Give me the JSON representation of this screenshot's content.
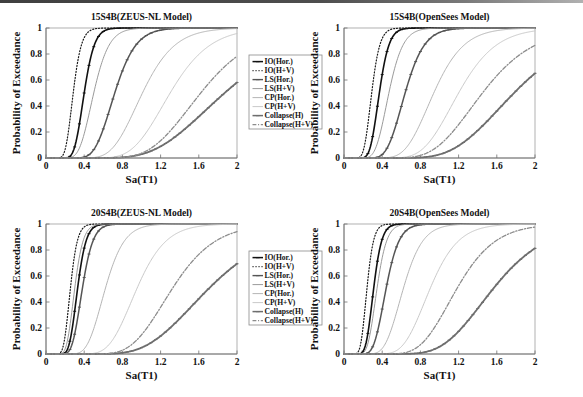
{
  "figure": {
    "background_color": "#ffffff",
    "panel_count": 4
  },
  "axes": {
    "xlabel": "Sa(T1)",
    "ylabel": "Probability of Exceedance",
    "xticks": [
      "0",
      "0.4",
      "0.8",
      "1.2",
      "1.6",
      "2"
    ],
    "yticks": [
      "0",
      "0.2",
      "0.4",
      "0.6",
      "0.8",
      "1"
    ],
    "xlim": [
      0,
      2
    ],
    "ylim": [
      0,
      1
    ]
  },
  "legend": {
    "entries": [
      {
        "label": "IO(Hor.)",
        "style": "solid-marker",
        "color": "#111111",
        "width": 1.5,
        "marker": true
      },
      {
        "label": "IO(H+V)",
        "style": "dotted",
        "color": "#1a1a1a",
        "width": 1.2,
        "marker": false
      },
      {
        "label": "LS(Hor.)",
        "style": "solid-marker",
        "color": "#555555",
        "width": 1.4,
        "marker": true
      },
      {
        "label": "LS(H+V)",
        "style": "solid",
        "color": "#9a9a9a",
        "width": 1.0,
        "marker": false
      },
      {
        "label": "CP(Hor.)",
        "style": "solid",
        "color": "#b5b5b5",
        "width": 1.0,
        "marker": false
      },
      {
        "label": "CP(H+V)",
        "style": "solid",
        "color": "#c9c9c9",
        "width": 1.0,
        "marker": false
      },
      {
        "label": "Collapse(H)",
        "style": "solid-marker",
        "color": "#6e6e6e",
        "width": 1.5,
        "marker": true
      },
      {
        "label": "Collapse(H+V)",
        "style": "dashdot",
        "color": "#8c8c8c",
        "width": 1.2,
        "marker": false
      }
    ]
  },
  "chart_data": [
    {
      "id": "panel-top-left",
      "type": "line",
      "title": "15S4B(ZEUS-NL Model)",
      "xlabel": "Sa(T1)",
      "ylabel": "Probability of Exceedance",
      "xlim": [
        0,
        2
      ],
      "ylim": [
        0,
        1
      ],
      "xticks": [
        0,
        0.4,
        0.8,
        1.2,
        1.6,
        2
      ],
      "yticks": [
        0,
        0.2,
        0.4,
        0.6,
        0.8,
        1
      ],
      "grid": false,
      "legend_position": "right-outside",
      "curve_model": "lognormal-cdf",
      "series": [
        {
          "name": "IO(Hor.)",
          "median": 0.4,
          "beta": 0.21,
          "style": "solid-marker",
          "color": "#111111",
          "width": 1.6
        },
        {
          "name": "IO(H+V)",
          "median": 0.285,
          "beta": 0.235,
          "style": "dotted",
          "color": "#1a1a1a",
          "width": 1.2
        },
        {
          "name": "LS(Hor.)",
          "median": 0.72,
          "beta": 0.24,
          "style": "solid-marker",
          "color": "#555555",
          "width": 1.5
        },
        {
          "name": "LS(H+V)",
          "median": 0.5,
          "beta": 0.25,
          "style": "solid",
          "color": "#9a9a9a",
          "width": 1.0
        },
        {
          "name": "CP(Hor.)",
          "median": 1.01,
          "beta": 0.26,
          "style": "solid",
          "color": "#b5b5b5",
          "width": 1.0
        },
        {
          "name": "CP(H+V)",
          "median": 1.3,
          "beta": 0.25,
          "style": "solid",
          "color": "#c9c9c9",
          "width": 1.0
        },
        {
          "name": "Collapse(H)",
          "median": 1.87,
          "beta": 0.33,
          "style": "solid-marker",
          "color": "#6e6e6e",
          "width": 1.8
        },
        {
          "name": "Collapse(H+V)",
          "median": 1.62,
          "beta": 0.27,
          "style": "dashdot",
          "color": "#8c8c8c",
          "width": 1.3
        }
      ]
    },
    {
      "id": "panel-top-right",
      "type": "line",
      "title": "15S4B(OpenSees Model)",
      "xlabel": "Sa(T1)",
      "ylabel": "Probability of Exceedance",
      "xlim": [
        0,
        2
      ],
      "ylim": [
        0,
        1
      ],
      "xticks": [
        0,
        0.4,
        0.8,
        1.2,
        1.6,
        2
      ],
      "yticks": [
        0,
        0.2,
        0.4,
        0.6,
        0.8,
        1
      ],
      "grid": false,
      "legend_position": "none",
      "curve_model": "lognormal-cdf",
      "series": [
        {
          "name": "IO(Hor.)",
          "median": 0.37,
          "beta": 0.215,
          "style": "solid-marker",
          "color": "#111111",
          "width": 1.6
        },
        {
          "name": "IO(H+V)",
          "median": 0.29,
          "beta": 0.23,
          "style": "dotted",
          "color": "#1a1a1a",
          "width": 1.2
        },
        {
          "name": "LS(Hor.)",
          "median": 0.64,
          "beta": 0.245,
          "style": "solid-marker",
          "color": "#555555",
          "width": 1.5
        },
        {
          "name": "LS(H+V)",
          "median": 0.47,
          "beta": 0.245,
          "style": "solid",
          "color": "#9a9a9a",
          "width": 1.0
        },
        {
          "name": "CP(Hor.)",
          "median": 0.94,
          "beta": 0.26,
          "style": "solid",
          "color": "#b5b5b5",
          "width": 1.0
        },
        {
          "name": "CP(H+V)",
          "median": 1.2,
          "beta": 0.255,
          "style": "solid",
          "color": "#c9c9c9",
          "width": 1.0
        },
        {
          "name": "Collapse(H)",
          "median": 1.78,
          "beta": 0.3,
          "style": "solid-marker",
          "color": "#6e6e6e",
          "width": 1.8
        },
        {
          "name": "Collapse(H+V)",
          "median": 1.45,
          "beta": 0.29,
          "style": "dashdot",
          "color": "#8c8c8c",
          "width": 1.3
        }
      ]
    },
    {
      "id": "panel-bottom-left",
      "type": "line",
      "title": "20S4B(ZEUS-NL Model)",
      "xlabel": "Sa(T1)",
      "ylabel": "Probability of Exceedance",
      "xlim": [
        0,
        2
      ],
      "ylim": [
        0,
        1
      ],
      "xticks": [
        0,
        0.4,
        0.8,
        1.2,
        1.6,
        2
      ],
      "yticks": [
        0,
        0.2,
        0.4,
        0.6,
        0.8,
        1
      ],
      "grid": false,
      "legend_position": "right-outside",
      "curve_model": "lognormal-cdf",
      "series": [
        {
          "name": "IO(Hor.)",
          "median": 0.33,
          "beta": 0.215,
          "style": "solid-marker",
          "color": "#111111",
          "width": 1.6
        },
        {
          "name": "IO(H+V)",
          "median": 0.255,
          "beta": 0.225,
          "style": "dotted",
          "color": "#1a1a1a",
          "width": 1.2
        },
        {
          "name": "LS(Hor.)",
          "median": 0.38,
          "beta": 0.23,
          "style": "solid-marker",
          "color": "#555555",
          "width": 1.5
        },
        {
          "name": "LS(H+V)",
          "median": 0.3,
          "beta": 0.23,
          "style": "solid",
          "color": "#9a9a9a",
          "width": 1.0
        },
        {
          "name": "CP(Hor.)",
          "median": 0.62,
          "beta": 0.25,
          "style": "solid",
          "color": "#b5b5b5",
          "width": 1.0
        },
        {
          "name": "CP(H+V)",
          "median": 0.95,
          "beta": 0.25,
          "style": "solid",
          "color": "#c9c9c9",
          "width": 1.0
        },
        {
          "name": "Collapse(H)",
          "median": 1.7,
          "beta": 0.32,
          "style": "solid-marker",
          "color": "#6e6e6e",
          "width": 1.8
        },
        {
          "name": "Collapse(H+V)",
          "median": 1.32,
          "beta": 0.265,
          "style": "dashdot",
          "color": "#8c8c8c",
          "width": 1.3
        }
      ]
    },
    {
      "id": "panel-bottom-right",
      "type": "line",
      "title": "20S4B(OpenSees Model)",
      "xlabel": "Sa(T1)",
      "ylabel": "Probability of Exceedance",
      "xlim": [
        0,
        2
      ],
      "ylim": [
        0,
        1
      ],
      "xticks": [
        0,
        0.4,
        0.8,
        1.2,
        1.6,
        2
      ],
      "yticks": [
        0,
        0.2,
        0.4,
        0.6,
        0.8,
        1
      ],
      "grid": false,
      "legend_position": "none",
      "curve_model": "lognormal-cdf",
      "series": [
        {
          "name": "IO(Hor.)",
          "median": 0.31,
          "beta": 0.215,
          "style": "solid-marker",
          "color": "#111111",
          "width": 1.6
        },
        {
          "name": "IO(H+V)",
          "median": 0.24,
          "beta": 0.225,
          "style": "dotted",
          "color": "#1a1a1a",
          "width": 1.2
        },
        {
          "name": "LS(Hor.)",
          "median": 0.44,
          "beta": 0.24,
          "style": "solid-marker",
          "color": "#555555",
          "width": 1.5
        },
        {
          "name": "LS(H+V)",
          "median": 0.345,
          "beta": 0.23,
          "style": "solid",
          "color": "#9a9a9a",
          "width": 1.0
        },
        {
          "name": "CP(Hor.)",
          "median": 0.62,
          "beta": 0.255,
          "style": "solid",
          "color": "#b5b5b5",
          "width": 1.0
        },
        {
          "name": "CP(H+V)",
          "median": 0.9,
          "beta": 0.255,
          "style": "solid",
          "color": "#c9c9c9",
          "width": 1.0
        },
        {
          "name": "Collapse(H)",
          "median": 1.56,
          "beta": 0.28,
          "style": "solid-marker",
          "color": "#6e6e6e",
          "width": 1.8
        },
        {
          "name": "Collapse(H+V)",
          "median": 1.18,
          "beta": 0.265,
          "style": "dashdot",
          "color": "#8c8c8c",
          "width": 1.3
        }
      ]
    }
  ]
}
